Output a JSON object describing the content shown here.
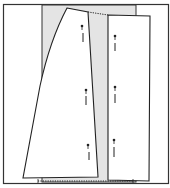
{
  "diagram": {
    "title": "Pattern pieces pinned on folded fabric",
    "colors": {
      "background": "#ffffff",
      "fabric_shade": "#e4e4e4",
      "line": "#222222",
      "frame": "#333333"
    },
    "pieces": [
      {
        "name": "flared-skirt-piece",
        "label": ""
      },
      {
        "name": "straight-panel-piece",
        "label": ""
      }
    ],
    "pins": {
      "left_piece": 3,
      "right_piece": 3
    }
  }
}
